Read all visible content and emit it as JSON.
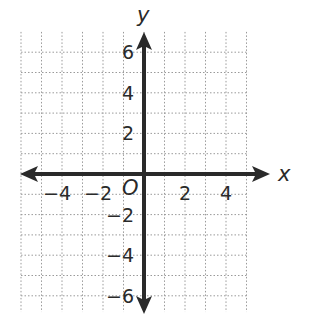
{
  "chart_data": {
    "type": "coordinate-plane",
    "title": "",
    "xlabel": "x",
    "ylabel": "y",
    "origin_label": "O",
    "xlim": [
      -6,
      6
    ],
    "ylim": [
      -6,
      6
    ],
    "grid": true,
    "grid_style": "dotted",
    "x_ticks": [
      {
        "value": -4,
        "label": "−4"
      },
      {
        "value": -2,
        "label": "−2"
      },
      {
        "value": 2,
        "label": "2"
      },
      {
        "value": 4,
        "label": "4"
      }
    ],
    "y_ticks": [
      {
        "value": 6,
        "label": "6"
      },
      {
        "value": 4,
        "label": "4"
      },
      {
        "value": 2,
        "label": "2"
      },
      {
        "value": -2,
        "label": "−2"
      },
      {
        "value": -4,
        "label": "−4"
      },
      {
        "value": -6,
        "label": "−6"
      }
    ],
    "series": []
  },
  "colors": {
    "axis": "#2a2a2a",
    "grid": "#9a9a9a",
    "background": "#ffffff"
  }
}
